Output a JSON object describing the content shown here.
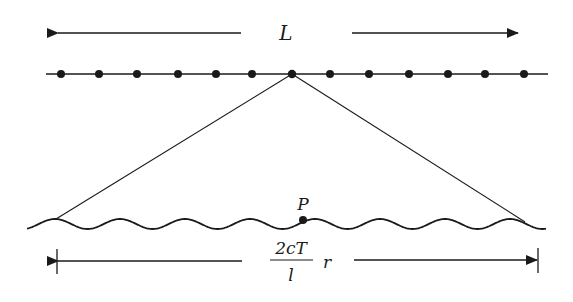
{
  "diagram": {
    "top_span_label": "L",
    "point_label": "P",
    "bottom_span_label": {
      "numerator": "2cT",
      "denominator": "l",
      "suffix": "r"
    },
    "top_dots_x": [
      61,
      99,
      137,
      178,
      216,
      252,
      292,
      330,
      369,
      409,
      448,
      485,
      524
    ],
    "apex_dot_index": 6,
    "colors": {
      "stroke": "#1a1a1a",
      "background": "#ffffff"
    }
  }
}
